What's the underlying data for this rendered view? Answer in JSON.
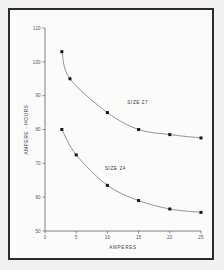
{
  "figure": {
    "background_color": "#f2f1ef",
    "panel_color": "#fbfbfa",
    "frame_color": "#2b2b2b"
  },
  "chart_data": {
    "type": "line",
    "title": "",
    "xlabel": "AMPERES",
    "ylabel": "AMPERE - HOURS",
    "xlim": [
      0,
      25
    ],
    "ylim": [
      50,
      110
    ],
    "xticks": [
      0,
      5,
      10,
      15,
      20,
      25
    ],
    "xtick_labels": [
      "0",
      "5",
      "10",
      "15",
      "20",
      "25"
    ],
    "yticks": [
      50,
      60,
      70,
      80,
      90,
      100,
      110
    ],
    "ytick_labels": [
      "50",
      "60",
      "70",
      "80",
      "90",
      "100",
      "110"
    ],
    "grid": false,
    "legend_position": "inline-annotations",
    "marker_style": "filled-square",
    "line_color": "#7a7a7a",
    "marker_color": "#16161a",
    "series": [
      {
        "name": "SIZE 27",
        "label_x": 13.2,
        "label_y": 87.5,
        "x": [
          2.7,
          4.0,
          10.0,
          15.0,
          20.0,
          25.0
        ],
        "values": [
          103.0,
          95.0,
          85.0,
          80.0,
          78.5,
          77.5
        ]
      },
      {
        "name": "SIZE 24",
        "label_x": 9.6,
        "label_y": 68.0,
        "x": [
          2.7,
          5.0,
          10.0,
          15.0,
          20.0,
          25.0
        ],
        "values": [
          80.0,
          72.5,
          63.5,
          59.0,
          56.5,
          55.5
        ]
      }
    ]
  }
}
